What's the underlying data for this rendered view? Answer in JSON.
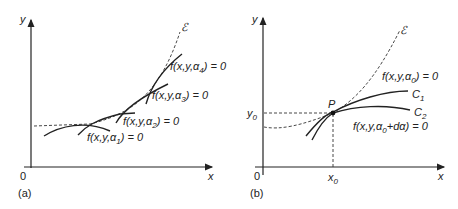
{
  "panel_a": {
    "tag": "(a)",
    "origin": "0",
    "x_axis": "x",
    "y_axis": "y",
    "envelope": "ℰ",
    "curves": [
      {
        "label": "f(x,y,α₁) = 0",
        "f": "f(x,y,α",
        "sub": "1",
        "tail": ") = 0"
      },
      {
        "label": "f(x,y,α₂) = 0",
        "f": "f(x,y,α",
        "sub": "2",
        "tail": ") = 0"
      },
      {
        "label": "f(x,y,α₃) = 0",
        "f": "f(x,y,α",
        "sub": "3",
        "tail": ") = 0"
      },
      {
        "label": "f(x,y,α₄) = 0",
        "f": "f(x,y,α",
        "sub": "4",
        "tail": ") = 0"
      }
    ]
  },
  "panel_b": {
    "tag": "(b)",
    "origin": "0",
    "x_axis": "x",
    "y_axis": "y",
    "x0": "x",
    "x0_sub": "0",
    "y0": "y",
    "y0_sub": "0",
    "point": "P",
    "envelope": "ℰ",
    "c1": "C",
    "c1_sub": "1",
    "c2": "C",
    "c2_sub": "2",
    "eq1": {
      "f": "f(x,y,α",
      "sub": "0",
      "tail": ") = 0"
    },
    "eq2": {
      "f": "f(x,y,α",
      "sub": "0",
      "tail": "+dα) = 0"
    }
  }
}
